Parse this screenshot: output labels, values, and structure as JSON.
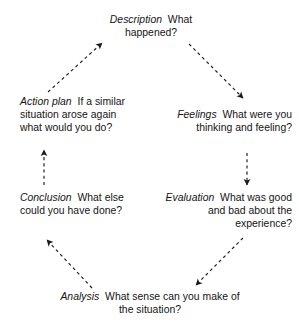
{
  "diagram": {
    "background_color": "#ffffff",
    "text_color": "#141414",
    "arrow_color": "#1a1a1a",
    "arrow_style": "dashed",
    "nodes": [
      {
        "id": "description",
        "term": "Description",
        "prompt": "What happened?",
        "position": "top",
        "align": "center"
      },
      {
        "id": "feelings",
        "term": "Feelings",
        "prompt": "What were you thinking and feeling?",
        "position": "upper-right",
        "align": "right"
      },
      {
        "id": "evaluation",
        "term": "Evaluation",
        "prompt": "What was good and bad about the experience?",
        "position": "lower-right",
        "align": "right"
      },
      {
        "id": "analysis",
        "term": "Analysis",
        "prompt": "What sense can you make of the situation?",
        "position": "bottom",
        "align": "center"
      },
      {
        "id": "conclusion",
        "term": "Conclusion",
        "prompt": "What else could you have done?",
        "position": "lower-left",
        "align": "left"
      },
      {
        "id": "actionplan",
        "term": "Action plan",
        "prompt": "If a similar situation arose again what would you do?",
        "position": "upper-left",
        "align": "left"
      }
    ],
    "connections": [
      {
        "id": "description-to-feelings",
        "from": "description",
        "to": "feelings",
        "direction": "down-right"
      },
      {
        "id": "feelings-to-evaluation",
        "from": "feelings",
        "to": "evaluation",
        "direction": "down"
      },
      {
        "id": "evaluation-to-analysis",
        "from": "evaluation",
        "to": "analysis",
        "direction": "down-left"
      },
      {
        "id": "analysis-to-conclusion",
        "from": "analysis",
        "to": "conclusion",
        "direction": "up-left"
      },
      {
        "id": "conclusion-to-actionplan",
        "from": "conclusion",
        "to": "actionplan",
        "direction": "up"
      },
      {
        "id": "actionplan-to-description",
        "from": "actionplan",
        "to": "description",
        "direction": "up-right"
      }
    ]
  }
}
